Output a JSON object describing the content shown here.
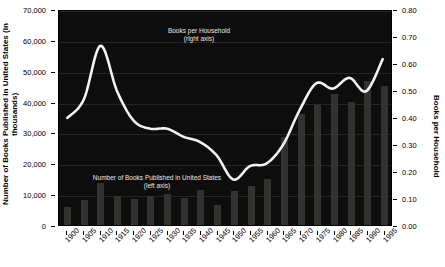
{
  "chart_data": {
    "type": "bar",
    "title": "",
    "xlabel": "",
    "ylabel": "Number of Books Published in United States (in thousands)",
    "y2label": "Books per Household",
    "categories": [
      "1900",
      "1905",
      "1910",
      "1915",
      "1920",
      "1925",
      "1930",
      "1935",
      "1940",
      "1945",
      "1950",
      "1955",
      "1960",
      "1965",
      "1970",
      "1975",
      "1980",
      "1985",
      "1990",
      "1995"
    ],
    "ylim": [
      0,
      70000
    ],
    "y2lim": [
      0.0,
      0.8
    ],
    "yticks": [
      "0",
      "10,000",
      "20,000",
      "30,000",
      "40,000",
      "50,000",
      "60,000",
      "70,000"
    ],
    "ytick_values": [
      0,
      10000,
      20000,
      30000,
      40000,
      50000,
      60000,
      70000
    ],
    "y2ticks": [
      "0.00",
      "0.10",
      "0.20",
      "0.30",
      "0.40",
      "0.50",
      "0.60",
      "0.70",
      "0.80"
    ],
    "y2tick_values": [
      0.0,
      0.1,
      0.2,
      0.3,
      0.4,
      0.5,
      0.6,
      0.7,
      0.8
    ],
    "grid": true,
    "legend_position": "inside-annotations",
    "series": [
      {
        "name": "Number of Books Published in United States",
        "type": "bar",
        "axis": "left",
        "color": "#33322f",
        "values": [
          6000,
          8000,
          13500,
          9500,
          8400,
          9500,
          10000,
          8800,
          11300,
          6500,
          11000,
          12600,
          15000,
          28600,
          36000,
          39000,
          42400,
          40000,
          46700,
          45000
        ]
      },
      {
        "name": "Books per Household",
        "type": "line",
        "axis": "right",
        "color": "#f2f2f2",
        "values": [
          0.4,
          0.47,
          0.67,
          0.5,
          0.39,
          0.36,
          0.36,
          0.33,
          0.31,
          0.26,
          0.17,
          0.22,
          0.23,
          0.3,
          0.43,
          0.53,
          0.51,
          0.55,
          0.5,
          0.62
        ]
      }
    ],
    "annotations": [
      {
        "name": "books-per-household-annotation",
        "line1": "Books per Household",
        "line2": "(right axis)"
      },
      {
        "name": "books-published-annotation",
        "line1": "Number of Books Published in United States",
        "line2": "(left axis)"
      }
    ],
    "colors": {
      "plot_background": "#0d0d0d",
      "bar": "#33322f",
      "line": "#f2f2f2",
      "page_background": "#ffffff",
      "text": "#000000",
      "annotation_text": "#e8e8e8"
    }
  }
}
